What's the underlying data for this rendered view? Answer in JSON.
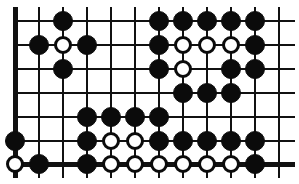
{
  "figure": {
    "kind": "go-board-diagram",
    "width": 299,
    "height": 184
  },
  "board": {
    "columns": 12,
    "rows": 7,
    "column_x": [
      15,
      39,
      63,
      87,
      111,
      135,
      159,
      183,
      207,
      231,
      255,
      279
    ],
    "row_y": [
      21,
      45,
      69,
      93,
      117,
      141,
      164
    ],
    "left_edge_is_board_edge": true,
    "bottom_edge_is_board_edge": true,
    "top_edge_is_board_edge": false,
    "right_edge_is_board_edge": false,
    "line_color": "#111111",
    "background_color": "#ffffff",
    "black_color": "#0b0b0b",
    "white_fill": "#ffffff",
    "white_outline": "#0b0b0b",
    "stone_radius": 10,
    "stone_radius_white": 9
  },
  "stones": [
    {
      "col": 3,
      "row": 1,
      "color": "black"
    },
    {
      "col": 7,
      "row": 1,
      "color": "black"
    },
    {
      "col": 8,
      "row": 1,
      "color": "black"
    },
    {
      "col": 9,
      "row": 1,
      "color": "black"
    },
    {
      "col": 10,
      "row": 1,
      "color": "black"
    },
    {
      "col": 11,
      "row": 1,
      "color": "black"
    },
    {
      "col": 2,
      "row": 2,
      "color": "black"
    },
    {
      "col": 3,
      "row": 2,
      "color": "white"
    },
    {
      "col": 4,
      "row": 2,
      "color": "black"
    },
    {
      "col": 7,
      "row": 2,
      "color": "black"
    },
    {
      "col": 8,
      "row": 2,
      "color": "white"
    },
    {
      "col": 9,
      "row": 2,
      "color": "white"
    },
    {
      "col": 10,
      "row": 2,
      "color": "white"
    },
    {
      "col": 11,
      "row": 2,
      "color": "black"
    },
    {
      "col": 3,
      "row": 3,
      "color": "black"
    },
    {
      "col": 7,
      "row": 3,
      "color": "black"
    },
    {
      "col": 8,
      "row": 3,
      "color": "white"
    },
    {
      "col": 10,
      "row": 3,
      "color": "black"
    },
    {
      "col": 11,
      "row": 3,
      "color": "black"
    },
    {
      "col": 8,
      "row": 4,
      "color": "black"
    },
    {
      "col": 9,
      "row": 4,
      "color": "black"
    },
    {
      "col": 10,
      "row": 4,
      "color": "black"
    },
    {
      "col": 4,
      "row": 5,
      "color": "black"
    },
    {
      "col": 5,
      "row": 5,
      "color": "black"
    },
    {
      "col": 6,
      "row": 5,
      "color": "black"
    },
    {
      "col": 7,
      "row": 5,
      "color": "black"
    },
    {
      "col": 1,
      "row": 6,
      "color": "black"
    },
    {
      "col": 4,
      "row": 6,
      "color": "black"
    },
    {
      "col": 5,
      "row": 6,
      "color": "white"
    },
    {
      "col": 6,
      "row": 6,
      "color": "white"
    },
    {
      "col": 7,
      "row": 6,
      "color": "black"
    },
    {
      "col": 8,
      "row": 6,
      "color": "black"
    },
    {
      "col": 9,
      "row": 6,
      "color": "black"
    },
    {
      "col": 10,
      "row": 6,
      "color": "black"
    },
    {
      "col": 11,
      "row": 6,
      "color": "black"
    },
    {
      "col": 1,
      "row": 7,
      "color": "white"
    },
    {
      "col": 2,
      "row": 7,
      "color": "black"
    },
    {
      "col": 4,
      "row": 7,
      "color": "black"
    },
    {
      "col": 5,
      "row": 7,
      "color": "white"
    },
    {
      "col": 6,
      "row": 7,
      "color": "white"
    },
    {
      "col": 7,
      "row": 7,
      "color": "white"
    },
    {
      "col": 8,
      "row": 7,
      "color": "white"
    },
    {
      "col": 9,
      "row": 7,
      "color": "white"
    },
    {
      "col": 10,
      "row": 7,
      "color": "white"
    },
    {
      "col": 11,
      "row": 7,
      "color": "black"
    }
  ]
}
